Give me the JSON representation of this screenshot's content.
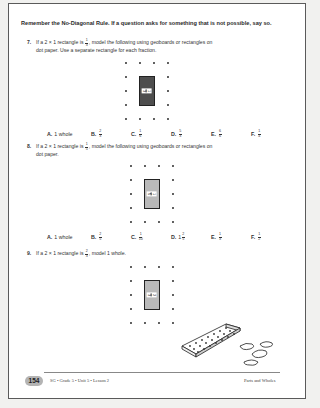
{
  "intro": "Remember the No-Diagonal Rule. If a question asks for something that is not possible, say so.",
  "questions": [
    {
      "number": "7.",
      "text_before": "If a 2 × 1 rectangle is",
      "fraction": {
        "num": "1",
        "den": "3"
      },
      "text_after": ", model the following using geoboards or rectangles on",
      "text_line2": "dot paper. Use a separate rectangle for each fraction.",
      "grid_label": {
        "num": "1",
        "den": "3"
      },
      "rect_shade": "#4e4e4e",
      "choices": [
        {
          "letter": "A.",
          "text": "1 whole"
        },
        {
          "letter": "B.",
          "num": "2",
          "den": "3"
        },
        {
          "letter": "C.",
          "num": "1",
          "den": "6"
        },
        {
          "letter": "D.",
          "num": "5",
          "den": "3"
        },
        {
          "letter": "E.",
          "num": "6",
          "den": "6"
        },
        {
          "letter": "F.",
          "num": "1",
          "den": "4"
        }
      ]
    },
    {
      "number": "8.",
      "text_before": "If a 2 × 1 rectangle is",
      "fraction": {
        "num": "1",
        "den": "5"
      },
      "text_after": ", model the following using geoboards or rectangles on",
      "text_line2": "dot paper.",
      "grid_label": {
        "num": "1",
        "den": "5"
      },
      "rect_shade": "#b9b9b9",
      "choices": [
        {
          "letter": "A.",
          "text": "1 whole"
        },
        {
          "letter": "B.",
          "num": "2",
          "den": "5"
        },
        {
          "letter": "C.",
          "num": "1",
          "den": "10"
        },
        {
          "letter": "D.",
          "whole": "1",
          "num": "2",
          "den": "5"
        },
        {
          "letter": "E.",
          "num": "1",
          "den": "3"
        },
        {
          "letter": "F.",
          "num": "1",
          "den": "2"
        }
      ]
    },
    {
      "number": "9.",
      "text_before": "If a 2 × 1 rectangle is",
      "fraction": {
        "num": "2",
        "den": "3"
      },
      "text_after": ", model 1 whole.",
      "text_line2": "",
      "grid_label": {
        "num": "2",
        "den": "3"
      },
      "rect_shade": "#b9b9b9",
      "choices": []
    }
  ],
  "footer": {
    "page_number": "154",
    "left_text": "SG • Grade 5 • Unit 5 • Lesson 2",
    "right_text": "Parts and Wholes"
  },
  "illustration": "geoboard-with-rubber-bands"
}
